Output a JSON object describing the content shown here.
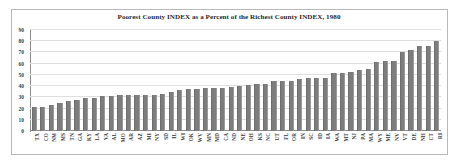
{
  "chart_data": {
    "type": "bar",
    "title": "Poorest County INDEX as a Percent of the Richest County INDEX, 1980",
    "xlabel": "",
    "ylabel": "",
    "ylim": [
      0,
      90
    ],
    "yticks": [
      0,
      10,
      20,
      30,
      40,
      50,
      60,
      70,
      80,
      90
    ],
    "grid": true,
    "legend": false,
    "bar_color": "#7d7d7d",
    "categories": [
      "TX",
      "CO",
      "NM",
      "MS",
      "TN",
      "GA",
      "KY",
      "LA",
      "VA",
      "AL",
      "MO",
      "AR",
      "AZ",
      "MI",
      "NY",
      "SD",
      "IL",
      "WI",
      "OK",
      "WV",
      "MN",
      "MD",
      "CA",
      "ND",
      "NE",
      "OH",
      "KS",
      "NC",
      "UT",
      "FL",
      "OR",
      "IN",
      "SC",
      "ID",
      "IA",
      "WA",
      "MT",
      "NJ",
      "PA",
      "MA",
      "WY",
      "ME",
      "NV",
      "VT",
      "DE",
      "NH",
      "CT",
      "RI"
    ],
    "values": [
      21,
      21.5,
      23.5,
      25,
      26.5,
      27.5,
      29,
      29.5,
      31,
      31.5,
      32,
      32.5,
      32.5,
      32.5,
      32.5,
      33,
      34.5,
      36.5,
      37,
      37.5,
      38,
      38,
      38,
      39.5,
      40.5,
      41,
      41.5,
      42,
      44.5,
      45,
      45,
      46.5,
      47,
      47,
      47.5,
      51.5,
      51.5,
      52.5,
      54,
      55.5,
      61.5,
      62.5,
      62.5,
      70,
      72,
      76,
      76,
      80
    ]
  }
}
